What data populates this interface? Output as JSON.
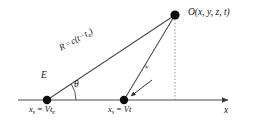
{
  "figure": {
    "type": "physics-geometry-diagram",
    "background_color": "#ffffff",
    "line_color": "#404040",
    "text_color": "#111111"
  },
  "labels": {
    "observer_point": "O(x, y, z, t)",
    "distance_relation_main": "R",
    "distance_relation_equals": "=",
    "distance_relation_expr": "c(t−t",
    "distance_relation_sub": "e",
    "distance_relation_close": ")",
    "emission_point": "E",
    "angle": "θ",
    "source_emission_position": "x",
    "source_emission_position_sub": "s",
    "source_emission_position_rhs": "= Vt",
    "source_emission_position_rhs_sub": "e",
    "source_current_position": "x",
    "source_current_position_sub": "s",
    "source_current_position_rhs": "= Vt",
    "axis_label": "x",
    "inline_small_label": "R"
  },
  "geometry": {
    "axis": {
      "x_start": 18,
      "x_end": 228,
      "y": 100,
      "has_arrowhead": true
    },
    "points": [
      {
        "name": "emission-point-E",
        "x": 47,
        "y": 100,
        "radius": 4.2,
        "label": "E"
      },
      {
        "name": "source-current-point",
        "x": 124,
        "y": 100,
        "radius": 4.2,
        "label": "x_s = Vt"
      },
      {
        "name": "observer-point-O",
        "x": 175,
        "y": 15,
        "radius": 4.6,
        "label": "O(x, y, z, t)"
      }
    ],
    "lines": [
      {
        "name": "retarded-ray-R",
        "from": [
          47,
          100
        ],
        "to": [
          175,
          15
        ]
      },
      {
        "name": "current-source-ray",
        "from": [
          124,
          100
        ],
        "to": [
          175,
          15
        ]
      },
      {
        "name": "vertical-dropline",
        "from": [
          175,
          15
        ],
        "to": [
          175,
          100
        ],
        "style": "dotted"
      }
    ],
    "angle_arc": {
      "name": "theta-arc",
      "center": [
        47,
        100
      ],
      "radius": 29,
      "start_deg": 0,
      "end_deg": 33.6
    },
    "pointer_arrow": {
      "name": "source-pointer-arrow",
      "from": [
        150,
        82
      ],
      "to": [
        129,
        97
      ]
    }
  }
}
